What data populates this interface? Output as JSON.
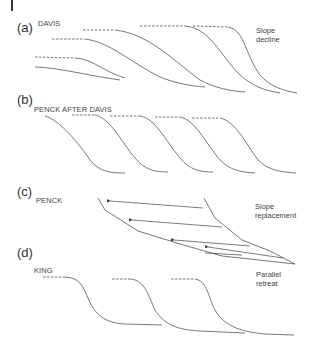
{
  "figure": {
    "panels": [
      {
        "id": "a",
        "label": "(a)",
        "name": "DAVIS",
        "note_line1": "Slope",
        "note_line2": "decline"
      },
      {
        "id": "b",
        "label": "(b)",
        "name": "PENCK AFTER DAVIS"
      },
      {
        "id": "c",
        "label": "(c)",
        "name": "PENCK",
        "note_line1": "Slope",
        "note_line2": "replacement"
      },
      {
        "id": "d",
        "label": "(d)",
        "name": "KING",
        "note_line1": "Parallel",
        "note_line2": "retreat"
      }
    ],
    "colors": {
      "line": "#555555",
      "text": "#333333"
    }
  }
}
